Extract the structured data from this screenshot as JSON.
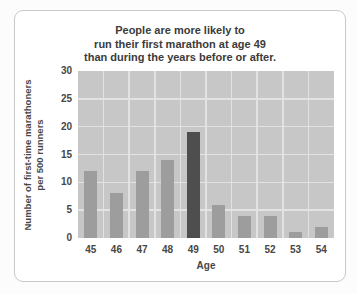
{
  "page": {
    "background": "#fcfcfc"
  },
  "card": {
    "background": "#ffffff",
    "border_color": "#c9c9c9"
  },
  "chart_data": {
    "type": "bar",
    "title": "People are more likely to\nrun their first marathon at age 49\nthan during the years before or after.",
    "xlabel": "Age",
    "ylabel": "Number of first-time marathoners\nper 500 runners",
    "categories": [
      "45",
      "46",
      "47",
      "48",
      "49",
      "50",
      "51",
      "52",
      "53",
      "54"
    ],
    "values": [
      12,
      8,
      12,
      14,
      19,
      6,
      4,
      4,
      1,
      2
    ],
    "highlight_category": "49",
    "highlight_index": 4,
    "ylim": [
      0,
      30
    ],
    "yticks": [
      0,
      5,
      10,
      15,
      20,
      25,
      30
    ],
    "grid": true,
    "legend": false,
    "colors": {
      "bar": "#9d9d9d",
      "highlight_bar": "#4e4e4e",
      "plot_background": "#c7c7c7",
      "gridline": "#e2e2e2",
      "title_text": "#3b3b3b",
      "tick_text": "#474747"
    }
  }
}
